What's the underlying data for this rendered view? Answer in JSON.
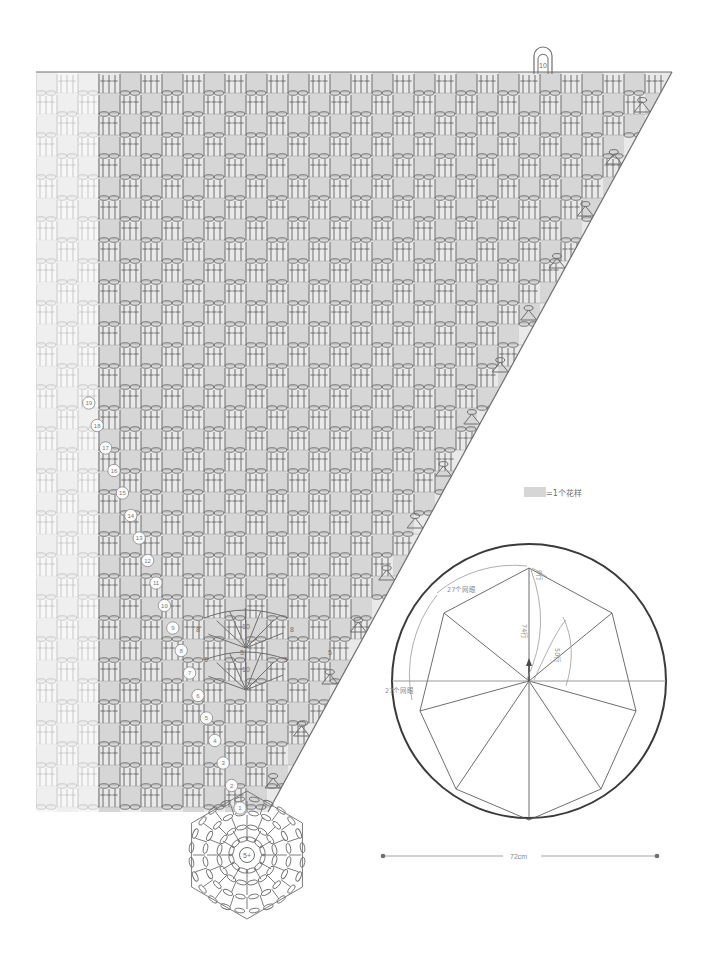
{
  "document": {
    "type": "crochet-pattern-chart",
    "title": "Crochet shawl / wrap stitch chart with assembly schematic"
  },
  "legend": {
    "swatch_color": "#d6d6d6",
    "equals": "=",
    "label": "1个花样",
    "full_text": "=1个花样"
  },
  "main_chart": {
    "name": "stitch-chart",
    "shape": "right-triangle wedge",
    "fill_color": "#d6d6d6",
    "light_fill_color": "#e6e6e6",
    "stroke_color": "#6e6e6e",
    "row_numbers": [
      "1",
      "2",
      "3",
      "4",
      "5",
      "6",
      "7",
      "8",
      "9",
      "10",
      "11",
      "12",
      "13",
      "14",
      "15",
      "16",
      "17",
      "18",
      "19"
    ],
    "stitch_count_labels": [
      "5",
      "5",
      "5",
      "5",
      "8",
      "8",
      "10",
      "10"
    ],
    "hanging_loop_label": "10",
    "center_ring_label": "5+",
    "faded_mirror": true
  },
  "schematic": {
    "name": "assembly-schematic",
    "circle_label": "umbrella outline",
    "annotations": [
      {
        "id": "rows-9",
        "text": "9行"
      },
      {
        "id": "rows-74",
        "text": "74行"
      },
      {
        "id": "rows-50",
        "text": "50行"
      },
      {
        "id": "mesh-27-upper",
        "text": "27个网眼"
      },
      {
        "id": "mesh-27-left",
        "text": "27个网眼"
      }
    ],
    "scale": {
      "value": "72cm",
      "name": "width-dimension"
    }
  }
}
